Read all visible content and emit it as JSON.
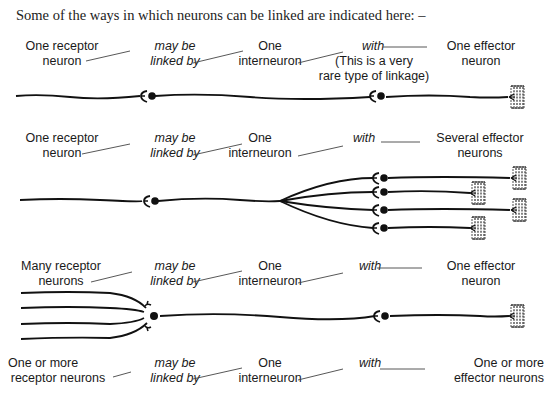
{
  "intro": "Some of the ways in which neurons can be linked are indicated here: –",
  "rows": [
    {
      "receptor": [
        "One receptor",
        "neuron"
      ],
      "link": [
        "may be",
        "linked by"
      ],
      "inter": [
        "One",
        "interneuron"
      ],
      "with": "with",
      "note": [
        "(This is a very",
        "rare type of  linkage)"
      ],
      "effector": [
        "One effector",
        "neuron"
      ]
    },
    {
      "receptor": [
        "One receptor",
        "neuron"
      ],
      "link": [
        "may be",
        "linked by"
      ],
      "inter": [
        "One",
        "interneuron"
      ],
      "with": "with",
      "effector": [
        "Several effector",
        "neurons"
      ]
    },
    {
      "receptor": [
        "Many receptor",
        "neurons"
      ],
      "link": [
        "may be",
        "linked by"
      ],
      "inter": [
        "One",
        "interneuron"
      ],
      "with": "with",
      "effector": [
        "One effector",
        "neuron"
      ]
    },
    {
      "receptor": [
        "One or more",
        "receptor neurons"
      ],
      "link": [
        "may be",
        "linked by"
      ],
      "inter": [
        "One",
        "interneuron"
      ],
      "with": "with",
      "effector": [
        "One or more",
        "effector neurons"
      ]
    }
  ],
  "icons": {
    "synapse": "dendrite-cell-body-icon",
    "effector": "muscle-effector-icon"
  }
}
